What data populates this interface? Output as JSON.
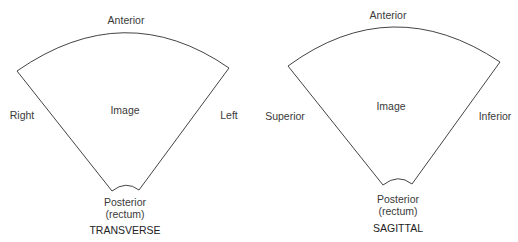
{
  "diagrams": [
    {
      "name": "transverse",
      "title": "TRANSVERSE",
      "center_label": "Image",
      "top_label": "Anterior",
      "left_label": "Right",
      "right_label": "Left",
      "bottom_label_line1": "Posterior",
      "bottom_label_line2": "(rectum)"
    },
    {
      "name": "sagittal",
      "title": "SAGITTAL",
      "center_label": "Image",
      "top_label": "Anterior",
      "left_label": "Superior",
      "right_label": "Inferior",
      "bottom_label_line1": "Posterior",
      "bottom_label_line2": "(rectum)"
    }
  ],
  "colors": {
    "outline": "#444444",
    "text": "#333333",
    "background": "#ffffff"
  }
}
